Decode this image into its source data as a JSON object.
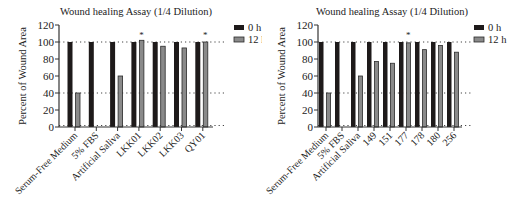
{
  "colors": {
    "bar_0h": "#1e1a1a",
    "bar_12h": "#8a8a8a",
    "bar_12h_stroke": "#2a2a2a",
    "axis": "#333333",
    "reference_line": "#444444"
  },
  "chart_data": [
    {
      "type": "bar",
      "title": "Wound healing Assay (1/4 Dilution)",
      "xlabel": "",
      "ylabel": "Percent of Wound Area",
      "ylim": [
        0,
        120
      ],
      "yticks": [
        0,
        20,
        40,
        60,
        80,
        100,
        120
      ],
      "grid": false,
      "reference_lines": [
        0,
        40,
        100
      ],
      "legend_position": "right",
      "categories": [
        "Serum-Free Medium",
        "5% FBS",
        "Artificial Saliva",
        "LKK01",
        "LKK02",
        "LKK03",
        "QY01"
      ],
      "series": [
        {
          "name": "0 h",
          "values": [
            100,
            100,
            100,
            100,
            100,
            100,
            100
          ]
        },
        {
          "name": "12 h",
          "values": [
            40,
            0,
            60,
            102,
            95,
            93,
            100
          ]
        }
      ],
      "annotations": [
        {
          "category": "LKK01",
          "text": "*"
        },
        {
          "category": "QY01",
          "text": "*"
        }
      ]
    },
    {
      "type": "bar",
      "title": "Wound healing Assay (1/4 Dilution)",
      "xlabel": "",
      "ylabel": "Percent of Wound Area",
      "ylim": [
        0,
        120
      ],
      "yticks": [
        0,
        20,
        40,
        60,
        80,
        100,
        120
      ],
      "grid": false,
      "reference_lines": [
        0,
        40,
        100
      ],
      "legend_position": "right",
      "categories": [
        "Serum-Free Medium",
        "5% FBS",
        "Artificial Saliva",
        "149",
        "151",
        "177",
        "178",
        "180",
        "256"
      ],
      "series": [
        {
          "name": "0 h",
          "values": [
            100,
            100,
            100,
            100,
            100,
            100,
            100,
            100,
            100
          ]
        },
        {
          "name": "12 h",
          "values": [
            40,
            0,
            60,
            77,
            75,
            99,
            91,
            96,
            88
          ]
        }
      ],
      "annotations": [
        {
          "category": "177",
          "text": "*"
        }
      ]
    }
  ],
  "layout": [
    {
      "axis_x": 59,
      "plot_right": 213,
      "ref_right": 224,
      "y_top": 25,
      "y_zero": 127,
      "first_tick": 75,
      "tick_step": 21.3,
      "bar_w": 5,
      "legend_x": 234,
      "title_x": 136
    },
    {
      "axis_x": 56,
      "plot_right": 200,
      "ref_right": 210,
      "y_top": 25,
      "y_zero": 127,
      "first_tick": 64,
      "tick_step": 16.0,
      "bar_w": 4.5,
      "legend_x": 212,
      "title_x": 130
    }
  ]
}
